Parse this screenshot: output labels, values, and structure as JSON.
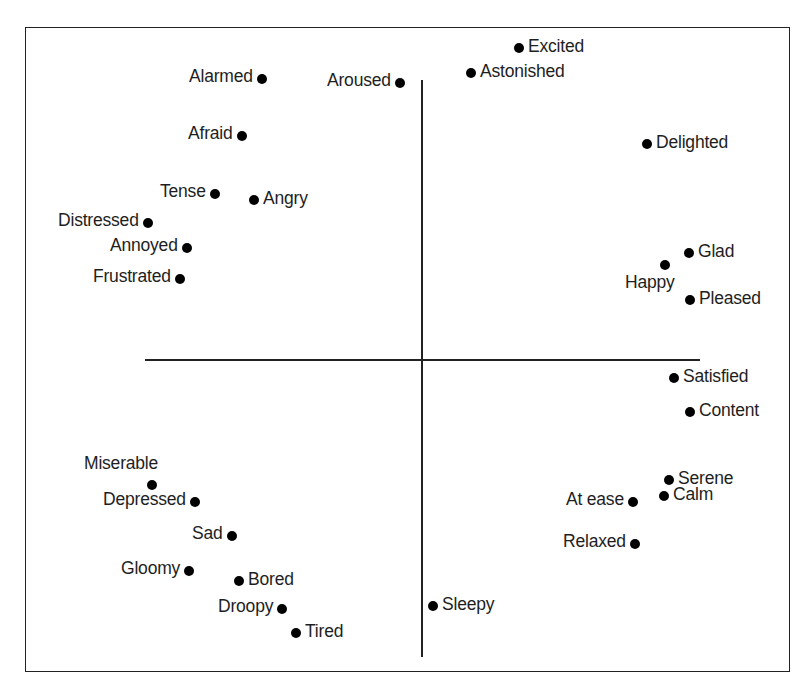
{
  "chart_data": {
    "type": "scatter",
    "title": "",
    "xlabel": "",
    "ylabel": "",
    "grid": false,
    "legend": "none",
    "axes": {
      "vertical": {
        "x": 422,
        "y1": 80,
        "y2": 657
      },
      "horizontal": {
        "y": 360,
        "x1": 145,
        "x2": 700
      }
    },
    "points": [
      {
        "label": "Excited",
        "x": 519,
        "y": 48,
        "label_side": "right"
      },
      {
        "label": "Astonished",
        "x": 471,
        "y": 73,
        "label_side": "right"
      },
      {
        "label": "Alarmed",
        "x": 262,
        "y": 79,
        "label_side": "left"
      },
      {
        "label": "Aroused",
        "x": 400,
        "y": 83,
        "label_side": "left"
      },
      {
        "label": "Afraid",
        "x": 242,
        "y": 136,
        "label_side": "left"
      },
      {
        "label": "Delighted",
        "x": 647,
        "y": 144,
        "label_side": "right"
      },
      {
        "label": "Tense",
        "x": 215,
        "y": 194,
        "label_side": "left"
      },
      {
        "label": "Angry",
        "x": 254,
        "y": 200,
        "label_side": "right"
      },
      {
        "label": "Distressed",
        "x": 148,
        "y": 223,
        "label_side": "left"
      },
      {
        "label": "Annoyed",
        "x": 187,
        "y": 248,
        "label_side": "left"
      },
      {
        "label": "Glad",
        "x": 689,
        "y": 253,
        "label_side": "right"
      },
      {
        "label": "Happy",
        "x": 665,
        "y": 265,
        "label_side": "below-left"
      },
      {
        "label": "Frustrated",
        "x": 180,
        "y": 279,
        "label_side": "left"
      },
      {
        "label": "Pleased",
        "x": 690,
        "y": 300,
        "label_side": "right"
      },
      {
        "label": "Satisfied",
        "x": 674,
        "y": 378,
        "label_side": "right"
      },
      {
        "label": "Content",
        "x": 690,
        "y": 412,
        "label_side": "right"
      },
      {
        "label": "Miserable",
        "x": 152,
        "y": 485,
        "label_side": "above-left"
      },
      {
        "label": "Serene",
        "x": 669,
        "y": 480,
        "label_side": "right"
      },
      {
        "label": "Calm",
        "x": 664,
        "y": 496,
        "label_side": "right"
      },
      {
        "label": "At ease",
        "x": 633,
        "y": 502,
        "label_side": "left"
      },
      {
        "label": "Depressed",
        "x": 195,
        "y": 502,
        "label_side": "left"
      },
      {
        "label": "Sad",
        "x": 232,
        "y": 536,
        "label_side": "left"
      },
      {
        "label": "Relaxed",
        "x": 635,
        "y": 544,
        "label_side": "left"
      },
      {
        "label": "Gloomy",
        "x": 189,
        "y": 571,
        "label_side": "left"
      },
      {
        "label": "Bored",
        "x": 239,
        "y": 581,
        "label_side": "right"
      },
      {
        "label": "Droopy",
        "x": 282,
        "y": 609,
        "label_side": "left"
      },
      {
        "label": "Sleepy",
        "x": 433,
        "y": 606,
        "label_side": "right"
      },
      {
        "label": "Tired",
        "x": 296,
        "y": 633,
        "label_side": "right"
      }
    ]
  }
}
